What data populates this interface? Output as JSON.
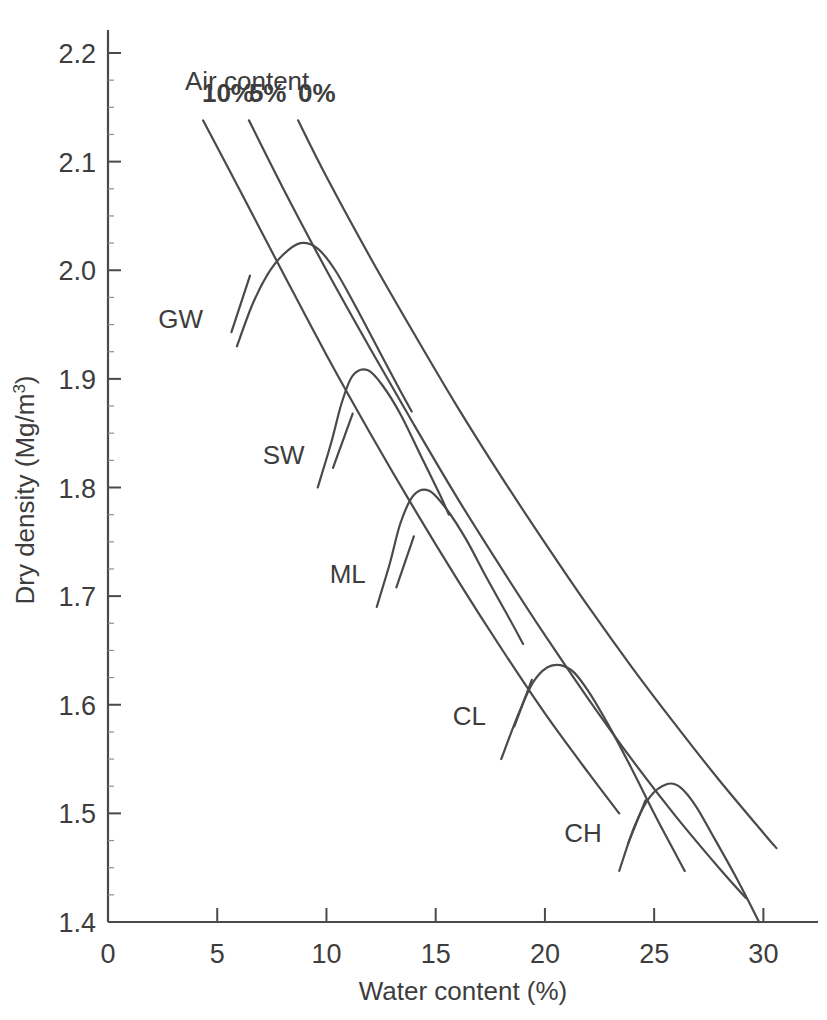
{
  "chart_data": {
    "type": "line",
    "title": "",
    "xlabel": "Water content (%)",
    "ylabel": "Dry density (Mg/m3)",
    "ylabel_base": "Dry density (Mg/m",
    "ylabel_sup": "3",
    "ylabel_tail": ")",
    "xlim": [
      0,
      32.5
    ],
    "ylim": [
      1.4,
      2.2
    ],
    "grid": false,
    "legend_position": "inside-top-left",
    "xticks": [
      0,
      5,
      10,
      15,
      20,
      25,
      30
    ],
    "xtick_labels": [
      "0",
      "5",
      "10",
      "15",
      "20",
      "25",
      "30"
    ],
    "x_minor_step": 1,
    "yticks": [
      1.4,
      1.5,
      1.6,
      1.7,
      1.8,
      1.9,
      2.0,
      2.1,
      2.2
    ],
    "ytick_labels": [
      "1.4",
      "1.5",
      "1.6",
      "1.7",
      "1.8",
      "1.9",
      "2.0",
      "2.1",
      "2.2"
    ],
    "y_minor_step": 0.025,
    "line_color": "#4a4a4a",
    "line_width": 2.2,
    "annotation_group_title": "Air content",
    "air_lines": [
      {
        "name": "10%",
        "label": "10%",
        "label_x": 4.3,
        "label_y": 2.155,
        "points": [
          [
            4.35,
            2.138
          ],
          [
            6.0,
            2.075
          ],
          [
            8.0,
            1.998
          ],
          [
            10.0,
            1.922
          ],
          [
            12.0,
            1.85
          ],
          [
            14.0,
            1.781
          ],
          [
            16.0,
            1.715
          ],
          [
            18.0,
            1.652
          ],
          [
            20.0,
            1.592
          ],
          [
            22.0,
            1.537
          ],
          [
            23.4,
            1.5
          ]
        ]
      },
      {
        "name": "5%",
        "label": "5%",
        "label_x": 6.45,
        "label_y": 2.155,
        "points": [
          [
            6.45,
            2.138
          ],
          [
            8.0,
            2.076
          ],
          [
            10.0,
            2.0
          ],
          [
            12.0,
            1.928
          ],
          [
            14.0,
            1.858
          ],
          [
            16.0,
            1.79
          ],
          [
            18.0,
            1.726
          ],
          [
            20.0,
            1.664
          ],
          [
            22.0,
            1.605
          ],
          [
            24.0,
            1.549
          ],
          [
            26.0,
            1.497
          ],
          [
            28.0,
            1.449
          ],
          [
            29.2,
            1.422
          ]
        ]
      },
      {
        "name": "0%",
        "label": "0%",
        "label_x": 8.7,
        "label_y": 2.155,
        "points": [
          [
            8.7,
            2.138
          ],
          [
            10.0,
            2.086
          ],
          [
            12.0,
            2.012
          ],
          [
            14.0,
            1.942
          ],
          [
            16.0,
            1.874
          ],
          [
            18.0,
            1.81
          ],
          [
            20.0,
            1.749
          ],
          [
            22.0,
            1.69
          ],
          [
            24.0,
            1.634
          ],
          [
            26.0,
            1.581
          ],
          [
            28.0,
            1.53
          ],
          [
            30.0,
            1.482
          ],
          [
            30.6,
            1.468
          ]
        ]
      }
    ],
    "soil_curves": [
      {
        "name": "GW",
        "label": "GW",
        "label_x": 4.35,
        "label_y": 1.955,
        "leader": [
          [
            5.65,
            1.943
          ],
          [
            6.5,
            1.995
          ]
        ],
        "peak": [
          8.8,
          2.025
        ],
        "points": [
          [
            5.9,
            1.93
          ],
          [
            6.6,
            1.968
          ],
          [
            7.3,
            1.996
          ],
          [
            8.0,
            2.014
          ],
          [
            8.8,
            2.025
          ],
          [
            9.6,
            2.02
          ],
          [
            10.4,
            2.0
          ],
          [
            11.3,
            1.968
          ],
          [
            12.3,
            1.93
          ],
          [
            13.3,
            1.892
          ],
          [
            13.9,
            1.87
          ]
        ]
      },
      {
        "name": "SW",
        "label": "SW",
        "label_x": 9.0,
        "label_y": 1.83,
        "leader": [
          [
            10.3,
            1.818
          ],
          [
            11.2,
            1.868
          ]
        ],
        "peak": [
          11.2,
          1.908
        ],
        "points": [
          [
            9.6,
            1.8
          ],
          [
            10.2,
            1.84
          ],
          [
            10.7,
            1.878
          ],
          [
            11.2,
            1.903
          ],
          [
            11.9,
            1.908
          ],
          [
            12.6,
            1.893
          ],
          [
            13.4,
            1.867
          ],
          [
            14.3,
            1.83
          ],
          [
            15.2,
            1.793
          ],
          [
            15.6,
            1.775
          ]
        ]
      },
      {
        "name": "ML",
        "label": "ML",
        "label_x": 11.8,
        "label_y": 1.72,
        "leader": [
          [
            13.2,
            1.708
          ],
          [
            14.0,
            1.755
          ]
        ],
        "peak": [
          14.0,
          1.797
        ],
        "points": [
          [
            12.3,
            1.69
          ],
          [
            12.9,
            1.73
          ],
          [
            13.4,
            1.768
          ],
          [
            14.0,
            1.793
          ],
          [
            14.7,
            1.797
          ],
          [
            15.5,
            1.78
          ],
          [
            16.4,
            1.752
          ],
          [
            17.3,
            1.718
          ],
          [
            18.3,
            1.682
          ],
          [
            19.0,
            1.656
          ]
        ]
      },
      {
        "name": "CL",
        "label": "CL",
        "label_x": 17.3,
        "label_y": 1.59,
        "leader": [
          [
            18.6,
            1.58
          ],
          [
            19.4,
            1.623
          ]
        ],
        "peak": [
          20.3,
          1.637
        ],
        "points": [
          [
            18.0,
            1.55
          ],
          [
            18.8,
            1.592
          ],
          [
            19.5,
            1.622
          ],
          [
            20.3,
            1.636
          ],
          [
            21.2,
            1.632
          ],
          [
            22.0,
            1.612
          ],
          [
            23.0,
            1.578
          ],
          [
            24.0,
            1.54
          ],
          [
            25.0,
            1.5
          ],
          [
            26.0,
            1.462
          ],
          [
            26.4,
            1.447
          ]
        ]
      },
      {
        "name": "CH",
        "label": "CH",
        "label_x": 22.6,
        "label_y": 1.482,
        "leader": [
          [
            23.8,
            1.472
          ],
          [
            24.6,
            1.512
          ]
        ],
        "peak": [
          25.9,
          1.526
        ],
        "points": [
          [
            23.4,
            1.447
          ],
          [
            24.1,
            1.488
          ],
          [
            24.8,
            1.515
          ],
          [
            25.6,
            1.527
          ],
          [
            26.2,
            1.524
          ],
          [
            26.9,
            1.507
          ],
          [
            27.7,
            1.479
          ],
          [
            28.7,
            1.443
          ],
          [
            29.5,
            1.412
          ],
          [
            29.8,
            1.4
          ]
        ]
      }
    ]
  }
}
